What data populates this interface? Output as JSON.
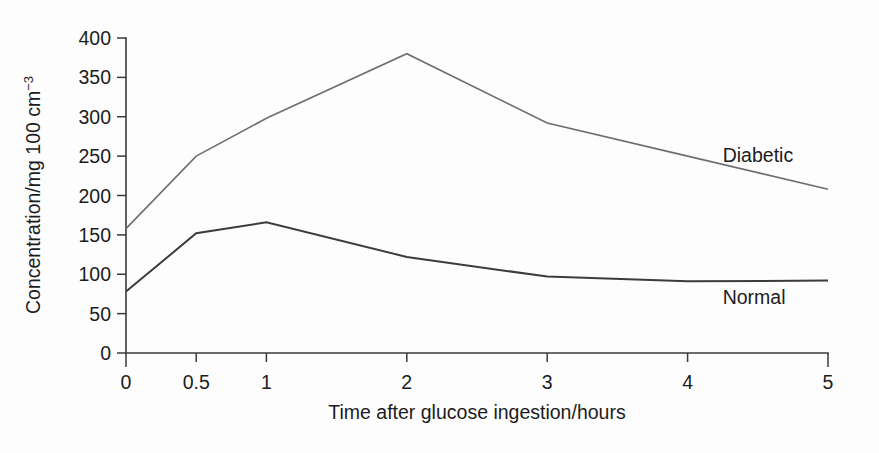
{
  "chart_data": {
    "type": "line",
    "title": "",
    "xlabel": "Time after glucose ingestion/hours",
    "ylabel": "Concentration/mg 100 cm⁻³",
    "ylabel_main": "Concentration/mg 100 cm",
    "ylabel_exponent": "−3",
    "x": [
      0,
      0.5,
      1,
      2,
      3,
      4,
      5
    ],
    "xtick_labels": [
      "0",
      "0.5",
      "1",
      "2",
      "3",
      "4",
      "5"
    ],
    "ytick_labels": [
      "0",
      "50",
      "100",
      "150",
      "200",
      "250",
      "300",
      "350",
      "400"
    ],
    "yticks": [
      0,
      50,
      100,
      150,
      200,
      250,
      300,
      350,
      400
    ],
    "xlim": [
      0,
      5
    ],
    "ylim": [
      0,
      400
    ],
    "grid": false,
    "legend_position": "inline-right",
    "series": [
      {
        "name": "Diabetic",
        "label": "Diabetic",
        "color": "#6e6e6e",
        "width": 1.6,
        "values": [
          158,
          250,
          298,
          380,
          292,
          250,
          208
        ],
        "label_x": 4.25,
        "label_y": 243
      },
      {
        "name": "Normal",
        "label": "Normal",
        "color": "#3c3c3c",
        "width": 2.0,
        "values": [
          78,
          152,
          166,
          122,
          97,
          91,
          92
        ],
        "label_x": 4.25,
        "label_y": 62
      }
    ]
  },
  "colors": {
    "background": "#fdfdfd",
    "axis": "#3a3a3a",
    "text": "#1c1c1c",
    "diabetic": "#6e6e6e",
    "normal": "#3c3c3c"
  }
}
